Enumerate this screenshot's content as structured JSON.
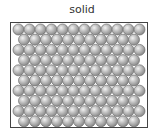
{
  "diagram": {
    "title": "solid",
    "state_of_matter": "solid",
    "arrangement": "hexagonal close-packed lattice",
    "rows": 10,
    "spheres_per_row": [
      12,
      11,
      12,
      11,
      12,
      11,
      12,
      11,
      12,
      11
    ],
    "total_particles": 115,
    "colors": {
      "particle_fill_light": "#f2f2f2",
      "particle_fill_mid": "#b8b8b8",
      "particle_fill_dark": "#8a8a8a",
      "particle_outline": "#6e6e6e",
      "frame_border": "#444444",
      "background": "#ffffff"
    }
  }
}
